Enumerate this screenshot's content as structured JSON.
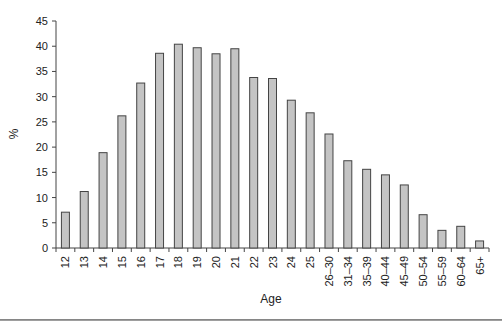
{
  "chart_data": {
    "type": "bar",
    "title": "",
    "xlabel": "Age",
    "ylabel": "%",
    "ylim": [
      0,
      45
    ],
    "yticks": [
      0,
      5,
      10,
      15,
      20,
      25,
      30,
      35,
      40,
      45
    ],
    "grid": false,
    "legend": null,
    "categories": [
      "12",
      "13",
      "14",
      "15",
      "16",
      "17",
      "18",
      "19",
      "20",
      "21",
      "22",
      "23",
      "24",
      "25",
      "26–30",
      "31–34",
      "35–39",
      "40–44",
      "45–49",
      "50–54",
      "55–59",
      "60–64",
      "65+"
    ],
    "values": [
      7.1,
      11.2,
      18.9,
      26.2,
      32.7,
      38.6,
      40.4,
      39.7,
      38.5,
      39.5,
      33.8,
      33.6,
      29.3,
      26.8,
      22.6,
      17.3,
      15.6,
      14.5,
      12.5,
      6.6,
      3.5,
      4.3,
      1.4
    ],
    "colors": {
      "bar_fill": "#c4c4c4",
      "bar_stroke": "#444444",
      "axis": "#444444"
    }
  }
}
